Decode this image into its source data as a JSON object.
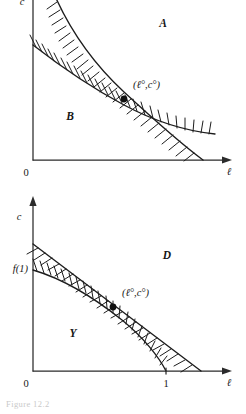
{
  "figure": {
    "caption": "Figure 12.2",
    "background_color": "#ffffff",
    "ink_color": "#1c1c1c"
  },
  "panels": [
    {
      "id": "top",
      "name": "panel-a-b",
      "axes": {
        "y_label": "c",
        "x_label": "ℓ",
        "origin_label": "0",
        "x_ticks": [],
        "y_ticks": []
      },
      "regions": [
        {
          "name": "region-a",
          "label": "A",
          "x": 163,
          "y": 24
        },
        {
          "name": "region-b",
          "label": "B",
          "x": 70,
          "y": 117
        }
      ],
      "point": {
        "name": "optimum-point",
        "label": "(ℓ°,c°)",
        "x": 0.52,
        "y": 0.4
      },
      "curves": [
        {
          "name": "upper-constraint-curve",
          "hatch_side": "left-below"
        },
        {
          "name": "lower-constraint-line",
          "hatch_side": "right-above"
        }
      ]
    },
    {
      "id": "bottom",
      "name": "panel-d-y",
      "axes": {
        "y_label": "c",
        "x_label": "ℓ",
        "origin_label": "0",
        "x_ticks": [
          {
            "label": "1",
            "x": 0.78
          }
        ],
        "y_ticks": [
          {
            "label": "f(1)",
            "y": 0.66
          }
        ]
      },
      "regions": [
        {
          "name": "region-d",
          "label": "D",
          "x": 167,
          "y": 70
        },
        {
          "name": "region-y",
          "label": "Y",
          "x": 73,
          "y": 148
        }
      ],
      "point": {
        "name": "optimum-point",
        "label": "(ℓ°,c°)",
        "x": 0.52,
        "y": 0.4
      },
      "curves": [
        {
          "name": "budget-line",
          "hatch_side": "left-below"
        },
        {
          "name": "production-constraint",
          "hatch_side": "right-above"
        }
      ]
    }
  ]
}
